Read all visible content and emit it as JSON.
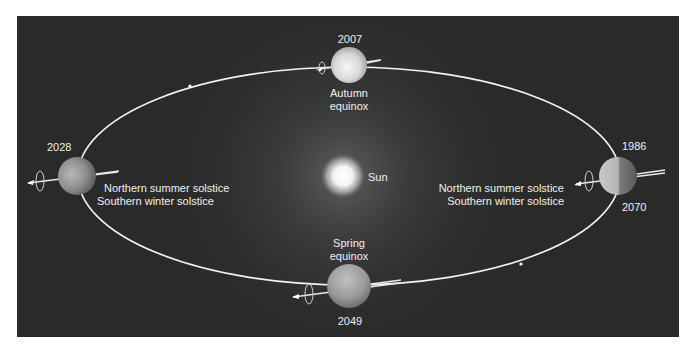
{
  "diagram": {
    "type": "orbit-diagram",
    "central_body": {
      "label": "Sun"
    },
    "positions": [
      {
        "id": "top",
        "years": [
          "2007"
        ],
        "label_lines": [
          "Autumn",
          "equinox"
        ]
      },
      {
        "id": "left",
        "years": [
          "2028"
        ],
        "label_lines": [
          "Northern summer solstice",
          "Southern winter solstice"
        ]
      },
      {
        "id": "right",
        "years": [
          "1986",
          "2070"
        ],
        "label_lines": [
          "Northern summer solstice",
          "Southern winter solstice"
        ]
      },
      {
        "id": "bottom",
        "years": [
          "2049"
        ],
        "label_lines": [
          "Spring",
          "equinox"
        ]
      }
    ],
    "colors": {
      "background": "#2a2a2a",
      "orbit": "#f2f2f2",
      "text": "#f0f0f0",
      "page": "#ffffff"
    }
  }
}
